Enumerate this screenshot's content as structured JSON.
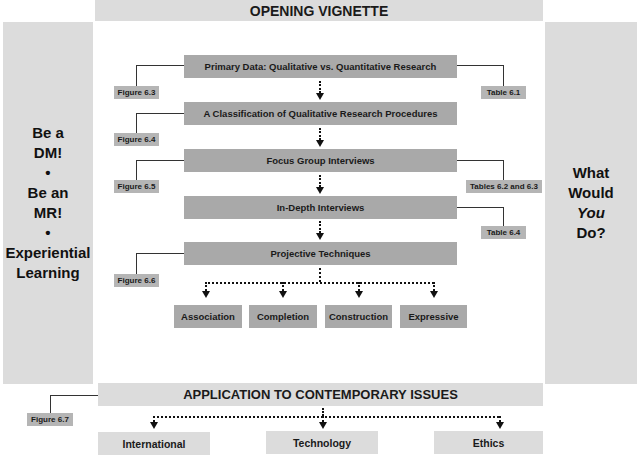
{
  "header": {
    "title": "OPENING VIGNETTE"
  },
  "left_panel": {
    "lines": [
      "Be a",
      "DM!",
      "•",
      "Be an",
      "MR!",
      "•",
      "Experiential",
      "Learning"
    ]
  },
  "right_panel": {
    "lines": [
      "What",
      "Would",
      "You",
      "Do?"
    ],
    "italic_word": "You"
  },
  "flow": {
    "steps": [
      {
        "label": "Primary Data: Qualitative vs. Quantitative Research",
        "left_ref": "Figure 6.3",
        "right_ref": "Table 6.1"
      },
      {
        "label": "A Classification of Qualitative Research Procedures",
        "left_ref": "Figure 6.4",
        "right_ref": ""
      },
      {
        "label": "Focus Group Interviews",
        "left_ref": "Figure 6.5",
        "right_ref": "Tables 6.2 and 6.3"
      },
      {
        "label": "In-Depth Interviews",
        "left_ref": "",
        "right_ref": "Table 6.4"
      },
      {
        "label": "Projective Techniques",
        "left_ref": "Figure 6.6",
        "right_ref": ""
      }
    ],
    "techniques": [
      "Association",
      "Completion",
      "Construction",
      "Expressive"
    ]
  },
  "footer": {
    "title": "APPLICATION TO CONTEMPORARY ISSUES",
    "ref": "Figure 6.7",
    "issues": [
      "International",
      "Technology",
      "Ethics"
    ]
  },
  "colors": {
    "light_panel": "#dcdcdc",
    "step_box": "#a9a9a9",
    "ref_tag": "#b5b5b5",
    "line": "#333333"
  }
}
